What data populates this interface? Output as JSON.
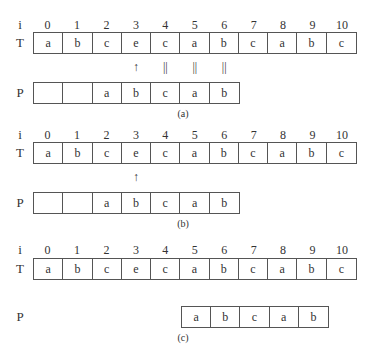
{
  "panels": [
    {
      "caption": "(a)",
      "row_labels": {
        "i": "i",
        "T": "T",
        "P": "P"
      },
      "indices": [
        "0",
        "1",
        "2",
        "3",
        "4",
        "5",
        "6",
        "7",
        "8",
        "9",
        "10"
      ],
      "T": [
        "a",
        "b",
        "c",
        "e",
        "c",
        "a",
        "b",
        "c",
        "a",
        "b",
        "c"
      ],
      "P": [
        "",
        "",
        "a",
        "b",
        "c",
        "a",
        "b"
      ],
      "P_offset": 0,
      "markers": [
        {
          "index": 3,
          "symbol": "↑",
          "meaning": "mismatch"
        },
        {
          "index": 4,
          "symbol": "||",
          "meaning": "match"
        },
        {
          "index": 5,
          "symbol": "||",
          "meaning": "match"
        },
        {
          "index": 6,
          "symbol": "||",
          "meaning": "match"
        }
      ]
    },
    {
      "caption": "(b)",
      "row_labels": {
        "i": "i",
        "T": "T",
        "P": "P"
      },
      "indices": [
        "0",
        "1",
        "2",
        "3",
        "4",
        "5",
        "6",
        "7",
        "8",
        "9",
        "10"
      ],
      "T": [
        "a",
        "b",
        "c",
        "e",
        "c",
        "a",
        "b",
        "c",
        "a",
        "b",
        "c"
      ],
      "P": [
        "",
        "",
        "a",
        "b",
        "c",
        "a",
        "b"
      ],
      "P_offset": 0,
      "markers": [
        {
          "index": 3,
          "symbol": "↑",
          "meaning": "mismatch"
        }
      ]
    },
    {
      "caption": "(c)",
      "row_labels": {
        "i": "i",
        "T": "T",
        "P": "P"
      },
      "indices": [
        "0",
        "1",
        "2",
        "3",
        "4",
        "5",
        "6",
        "7",
        "8",
        "9",
        "10"
      ],
      "T": [
        "a",
        "b",
        "c",
        "e",
        "c",
        "a",
        "b",
        "c",
        "a",
        "b",
        "c"
      ],
      "P": [
        "a",
        "b",
        "c",
        "a",
        "b"
      ],
      "P_offset": 5,
      "markers": []
    }
  ]
}
